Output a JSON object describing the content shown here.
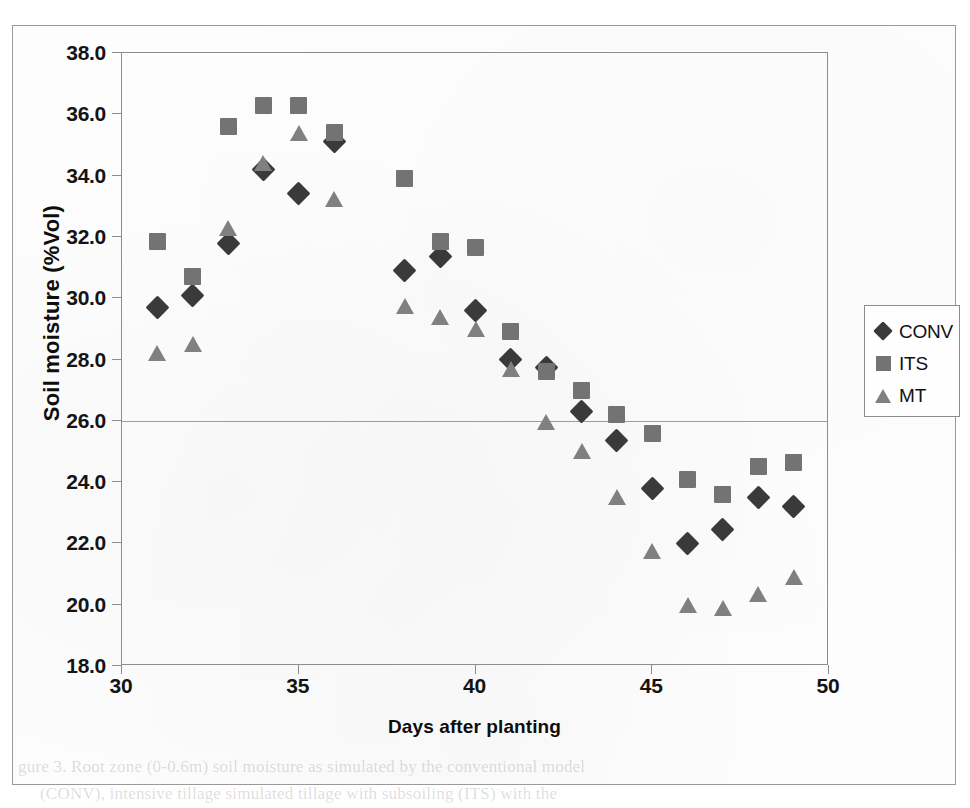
{
  "figure": {
    "border_color": "#9a9a9a",
    "background": "#ffffff"
  },
  "chart_data": {
    "type": "scatter",
    "title": "",
    "subtitle": "",
    "xlabel": "Days after planting",
    "ylabel": "Soil moisture (%Vol)",
    "xlim": [
      30,
      50
    ],
    "ylim": [
      18.0,
      38.0
    ],
    "xticks": [
      30,
      35,
      40,
      45,
      50
    ],
    "xtick_labels": [
      "30",
      "35",
      "40",
      "45",
      "50"
    ],
    "yticks": [
      18.0,
      20.0,
      22.0,
      24.0,
      26.0,
      28.0,
      30.0,
      32.0,
      34.0,
      36.0,
      38.0
    ],
    "ytick_labels": [
      "18.0",
      "20.0",
      "22.0",
      "24.0",
      "26.0",
      "28.0",
      "30.0",
      "32.0",
      "34.0",
      "36.0",
      "38.0"
    ],
    "grid": true,
    "gridlines_y": [
      26.0
    ],
    "legend_position": "right",
    "x": [
      31,
      32,
      33,
      34,
      35,
      36,
      38,
      39,
      40,
      41,
      42,
      43,
      44,
      45,
      46,
      47,
      48,
      49
    ],
    "series": [
      {
        "name": "CONV",
        "marker": "diamond",
        "color": "#3a3a3a",
        "values": [
          29.7,
          30.1,
          31.8,
          34.2,
          33.4,
          35.1,
          30.9,
          31.35,
          29.6,
          28.0,
          27.75,
          26.3,
          25.35,
          23.8,
          22.0,
          22.45,
          23.5,
          23.2
        ]
      },
      {
        "name": "ITS",
        "marker": "square",
        "color": "#737373",
        "values": [
          31.85,
          30.7,
          35.6,
          36.3,
          36.3,
          35.4,
          33.9,
          31.85,
          31.65,
          28.9,
          27.6,
          27.0,
          26.2,
          25.6,
          24.1,
          23.6,
          24.5,
          24.65
        ]
      },
      {
        "name": "MT",
        "marker": "triangle",
        "color": "#808080",
        "values": [
          28.2,
          28.5,
          32.3,
          34.4,
          35.4,
          33.25,
          29.75,
          29.4,
          29.0,
          27.7,
          25.95,
          25.0,
          23.5,
          21.75,
          20.0,
          19.9,
          20.35,
          20.9
        ]
      }
    ]
  },
  "legend": {
    "entries": [
      {
        "label": "CONV",
        "marker": "diamond"
      },
      {
        "label": "ITS",
        "marker": "square"
      },
      {
        "label": "MT",
        "marker": "triangle"
      }
    ]
  },
  "page_bleed": {
    "line1": "gure 3. Root zone (0-0.6m) soil moisture as simulated by the conventional model",
    "line2": "(CONV), intensive tillage simulated tillage with subsoiling (ITS) with the"
  }
}
